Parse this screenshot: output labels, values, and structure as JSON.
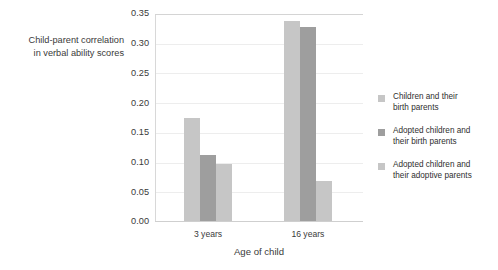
{
  "chart_data": {
    "type": "bar",
    "title": "",
    "subtitle": "",
    "xlabel": "Age of child",
    "ylabel": "Child-parent correlation in verbal ability scores",
    "ylabel_lines": [
      "Child-parent correlation",
      "in verbal ability scores"
    ],
    "categories": [
      "3 years",
      "16 years"
    ],
    "series": [
      {
        "name": "Children and their birth parents",
        "name_lines": [
          "Children and their",
          "birth parents"
        ],
        "color": "#c6c6c6",
        "values": [
          0.174,
          0.337
        ]
      },
      {
        "name": "Adopted children and their birth parents",
        "name_lines": [
          "Adopted children and",
          "their birth parents"
        ],
        "color": "#9e9e9e",
        "values": [
          0.111,
          0.327
        ]
      },
      {
        "name": "Adopted children and their adoptive parents",
        "name_lines": [
          "Adopted children and",
          "their adoptive parents"
        ],
        "color": "#c6c6c6",
        "values": [
          0.096,
          0.067
        ]
      }
    ],
    "ylim": [
      0.0,
      0.35
    ],
    "ytick_values": [
      0.0,
      0.05,
      0.1,
      0.15,
      0.2,
      0.25,
      0.3,
      0.35
    ],
    "ytick_labels": [
      "0.00",
      "0.05",
      "0.10",
      "0.15",
      "0.20",
      "0.25",
      "0.30",
      "0.35"
    ],
    "grid": true,
    "grid_axis": "y",
    "legend_position": "right",
    "background_color": "#ffffff",
    "grid_color": "#ededed",
    "axis_color": "#d4d4d4",
    "text_color": "#3a3a3a"
  }
}
